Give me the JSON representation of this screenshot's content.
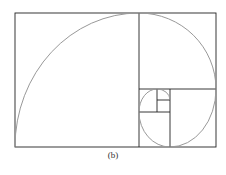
{
  "figure": {
    "caption": "(b)",
    "colors": {
      "lines": "#222222",
      "spiral": "#999999",
      "background": "#ffffff"
    }
  }
}
